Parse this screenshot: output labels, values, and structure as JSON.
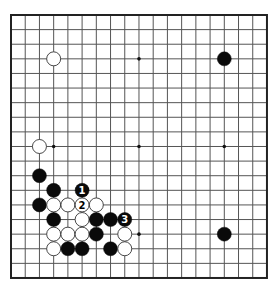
{
  "board": {
    "size": 19,
    "origin": {
      "x": 11,
      "y": 15
    },
    "spacing": {
      "x": 14.22,
      "y": 14.61
    },
    "stone_radius": 7,
    "colors": {
      "background": "#ffffff",
      "grid_line": "#555555",
      "border": "#222222",
      "black_stone": "#0a0a0a",
      "white_stone_fill": "#ffffff",
      "white_stone_stroke": "#333333",
      "star_point": "#111111"
    },
    "star_points": [
      {
        "col": 3,
        "row": 3
      },
      {
        "col": 9,
        "row": 3
      },
      {
        "col": 15,
        "row": 3
      },
      {
        "col": 3,
        "row": 9
      },
      {
        "col": 9,
        "row": 9
      },
      {
        "col": 15,
        "row": 9
      },
      {
        "col": 3,
        "row": 15
      },
      {
        "col": 9,
        "row": 15
      },
      {
        "col": 15,
        "row": 15
      }
    ],
    "stones": [
      {
        "color": "white",
        "col": 3,
        "row": 3
      },
      {
        "color": "black",
        "col": 15,
        "row": 3
      },
      {
        "color": "white",
        "col": 2,
        "row": 9
      },
      {
        "color": "black",
        "col": 2,
        "row": 11
      },
      {
        "color": "black",
        "col": 3,
        "row": 12
      },
      {
        "color": "black",
        "col": 5,
        "row": 12,
        "label": "1"
      },
      {
        "color": "black",
        "col": 2,
        "row": 13
      },
      {
        "color": "white",
        "col": 3,
        "row": 13
      },
      {
        "color": "white",
        "col": 4,
        "row": 13
      },
      {
        "color": "white",
        "col": 5,
        "row": 13,
        "label": "2"
      },
      {
        "color": "white",
        "col": 6,
        "row": 13
      },
      {
        "color": "black",
        "col": 3,
        "row": 14
      },
      {
        "color": "white",
        "col": 5,
        "row": 14
      },
      {
        "color": "black",
        "col": 6,
        "row": 14
      },
      {
        "color": "black",
        "col": 7,
        "row": 14
      },
      {
        "color": "black",
        "col": 8,
        "row": 14,
        "label": "3"
      },
      {
        "color": "white",
        "col": 3,
        "row": 15
      },
      {
        "color": "white",
        "col": 4,
        "row": 15
      },
      {
        "color": "white",
        "col": 5,
        "row": 15
      },
      {
        "color": "black",
        "col": 6,
        "row": 15
      },
      {
        "color": "white",
        "col": 8,
        "row": 15
      },
      {
        "color": "black",
        "col": 15,
        "row": 15
      },
      {
        "color": "white",
        "col": 3,
        "row": 16
      },
      {
        "color": "black",
        "col": 4,
        "row": 16
      },
      {
        "color": "black",
        "col": 5,
        "row": 16
      },
      {
        "color": "black",
        "col": 7,
        "row": 16
      },
      {
        "color": "white",
        "col": 8,
        "row": 16
      }
    ]
  }
}
